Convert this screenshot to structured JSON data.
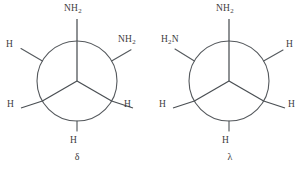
{
  "figure": {
    "type": "chemical-structure-diagram",
    "background_color": "#ffffff",
    "line_color": "#55595d",
    "text_color": "#3c3c3c"
  },
  "structures": [
    {
      "id": "delta",
      "name": "δ",
      "center": {
        "x": 77,
        "y": 81
      },
      "radius": 40,
      "substituents": [
        {
          "id": "d-front-top",
          "element": "N",
          "formula": "NH",
          "subscript": "2",
          "order": "front",
          "angle_deg": 90,
          "label_x": 64,
          "label_y": 4
        },
        {
          "id": "d-back-upper-right",
          "element": "N",
          "formula": "NH",
          "subscript": "2",
          "order": "back",
          "angle_deg": 30,
          "label_x": 118,
          "label_y": 35
        },
        {
          "id": "d-back-upper-left",
          "element": "H",
          "formula": "H",
          "subscript": "",
          "order": "back",
          "angle_deg": 150,
          "label_x": 6,
          "label_y": 40
        },
        {
          "id": "d-front-lower-left",
          "element": "H",
          "formula": "H",
          "subscript": "",
          "order": "front",
          "angle_deg": 210,
          "label_x": 7,
          "label_y": 100
        },
        {
          "id": "d-front-lower-right",
          "element": "H",
          "formula": "H",
          "subscript": "",
          "order": "front",
          "angle_deg": 330,
          "label_x": 124,
          "label_y": 100
        },
        {
          "id": "d-back-bottom",
          "element": "H",
          "formula": "H",
          "subscript": "",
          "order": "back",
          "angle_deg": 270,
          "label_x": 70,
          "label_y": 136
        }
      ]
    },
    {
      "id": "lambda",
      "name": "λ",
      "center": {
        "x": 229,
        "y": 81
      },
      "radius": 40,
      "substituents": [
        {
          "id": "l-front-top",
          "element": "N",
          "formula": "NH",
          "subscript": "2",
          "order": "front",
          "angle_deg": 90,
          "label_x": 216,
          "label_y": 4
        },
        {
          "id": "l-back-upper-left",
          "element": "N",
          "formula": "H",
          "subscript": "2",
          "suffix": "N",
          "order": "back",
          "angle_deg": 150,
          "label_x": 163,
          "label_y": 35
        },
        {
          "id": "l-back-upper-right",
          "element": "H",
          "formula": "H",
          "subscript": "",
          "order": "back",
          "angle_deg": 30,
          "label_x": 284,
          "label_y": 40
        },
        {
          "id": "l-front-lower-left",
          "element": "H",
          "formula": "H",
          "subscript": "",
          "order": "front",
          "angle_deg": 210,
          "label_x": 160,
          "label_y": 100
        },
        {
          "id": "l-front-lower-right",
          "element": "H",
          "formula": "H",
          "subscript": "",
          "order": "front",
          "angle_deg": 330,
          "label_x": 276,
          "label_y": 100
        },
        {
          "id": "l-back-bottom",
          "element": "H",
          "formula": "H",
          "subscript": "",
          "order": "back",
          "angle_deg": 270,
          "label_x": 222,
          "label_y": 136
        }
      ]
    }
  ],
  "labels": {
    "delta_name": "δ",
    "lambda_name": "λ",
    "nh2": "NH",
    "h2n_lead": "H",
    "h2n_trail": "N",
    "subscript_two": "2",
    "hydrogen": "H"
  }
}
